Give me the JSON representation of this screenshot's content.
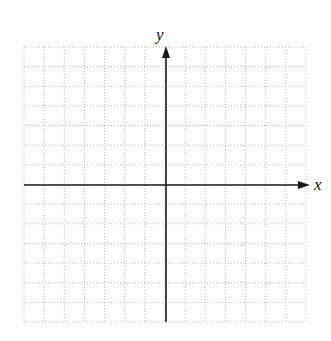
{
  "diagram": {
    "type": "coordinate-plane",
    "axes": {
      "x_label": "x",
      "y_label": "y"
    },
    "grid": {
      "columns": 14,
      "rows": 14,
      "style": "dotted",
      "line_color": "#b8b8b8"
    },
    "colors": {
      "axis": "#1a1a1a",
      "label": "#111111",
      "background": "#ffffff"
    }
  }
}
